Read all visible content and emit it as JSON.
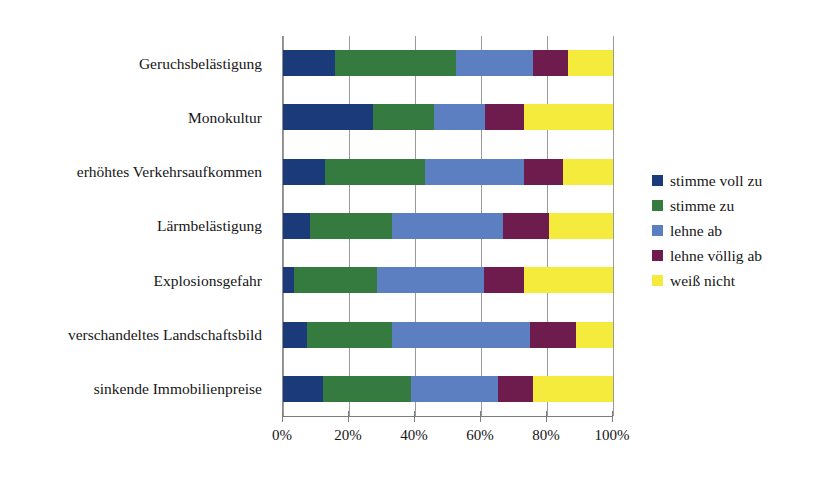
{
  "chart_data": {
    "type": "bar",
    "subtype": "stacked-horizontal-100pct",
    "title": "",
    "xlabel": "",
    "ylabel": "",
    "xlim": [
      0,
      100
    ],
    "xticks": [
      "0%",
      "20%",
      "40%",
      "60%",
      "80%",
      "100%"
    ],
    "xtick_values": [
      0,
      20,
      40,
      60,
      80,
      100
    ],
    "grid": true,
    "legend_position": "right",
    "categories": [
      "Geruchsbelästigung",
      "Monokultur",
      "erhöhtes Verkehrsaufkommen",
      "Lärmbelästigung",
      "Explosionsgefahr",
      "verschandeltes Landschaftsbild",
      "sinkende Immobilienpreise"
    ],
    "series": [
      {
        "name": "stimme voll zu",
        "color": "#1a3a7a",
        "values": [
          15.8,
          27.4,
          12.8,
          8.2,
          3.3,
          7.3,
          12.1
        ]
      },
      {
        "name": "stimme zu",
        "color": "#357a3f",
        "values": [
          36.7,
          18.3,
          30.2,
          24.8,
          25.1,
          25.7,
          26.7
        ]
      },
      {
        "name": "lehne ab",
        "color": "#5b7fc0",
        "values": [
          23.3,
          15.6,
          30.0,
          33.7,
          32.5,
          41.9,
          26.4
        ]
      },
      {
        "name": "lehne völlig ab",
        "color": "#6e1b4e",
        "values": [
          10.6,
          11.8,
          11.8,
          13.9,
          12.1,
          13.9,
          10.6
        ]
      },
      {
        "name": "weiß nicht",
        "color": "#f5eb3c",
        "values": [
          13.6,
          26.9,
          15.2,
          19.4,
          27.0,
          11.2,
          24.2
        ]
      }
    ]
  },
  "legend": {
    "items": [
      {
        "label": "stimme voll zu",
        "color": "#1a3a7a"
      },
      {
        "label": "stimme zu",
        "color": "#357a3f"
      },
      {
        "label": "lehne ab",
        "color": "#5b7fc0"
      },
      {
        "label": "lehne völlig ab",
        "color": "#6e1b4e"
      },
      {
        "label": "weiß nicht",
        "color": "#f5eb3c"
      }
    ]
  }
}
